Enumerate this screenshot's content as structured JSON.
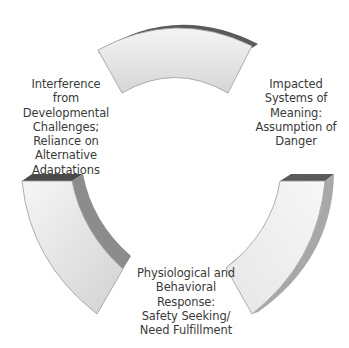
{
  "diagram": {
    "type": "cycle",
    "colors": {
      "face_light": "#f3f3f3",
      "face_mid": "#e2e2e2",
      "face_dark": "#cfcfcf",
      "edge": "#9a9a9a",
      "top_band": "#5a5a5a",
      "side_band": "#8c8c8c",
      "text": "#3a3a3a"
    },
    "nodes": [
      {
        "id": "impacted-systems",
        "lines": [
          "Impacted",
          "Systems of",
          "Meaning:",
          "Assumption of",
          "Danger"
        ]
      },
      {
        "id": "physiological-response",
        "lines": [
          "Physiological and",
          "Behavioral",
          "Response:",
          "Safety Seeking/",
          "Need Fulfillment"
        ]
      },
      {
        "id": "interference-developmental",
        "lines": [
          "Interference",
          "from",
          "Developmental",
          "Challenges;",
          "Reliance on",
          "Alternative",
          "Adaptations"
        ]
      }
    ]
  }
}
